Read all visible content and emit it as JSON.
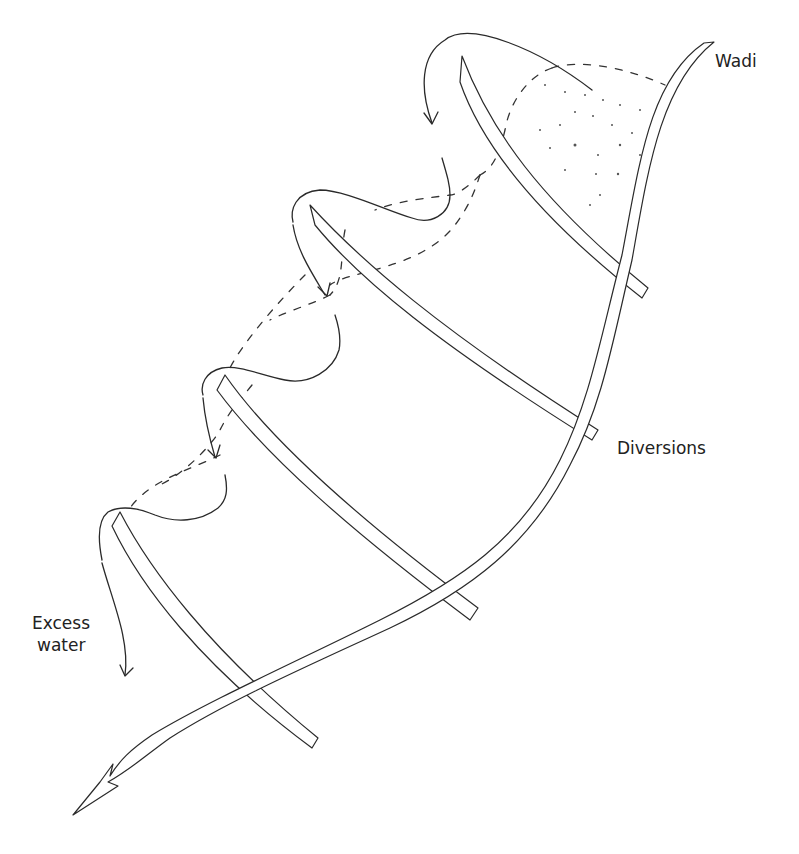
{
  "diagram": {
    "type": "line-drawing",
    "labels": {
      "wadi": "Wadi",
      "diversions": "Diversions",
      "excess_water_line1": "Excess",
      "excess_water_line2": "water"
    },
    "caption": "",
    "elements": {
      "wadi_channel": "main wadi channel (double line) with arrowhead at lower left",
      "diversion_count": 4,
      "excess_water_arrows": 4,
      "flow_lines": "dashed lines indicating spreading/flow between diversions"
    },
    "colors": {
      "line": "#2a2a2a",
      "background": "#ffffff",
      "text": "#222222"
    }
  }
}
